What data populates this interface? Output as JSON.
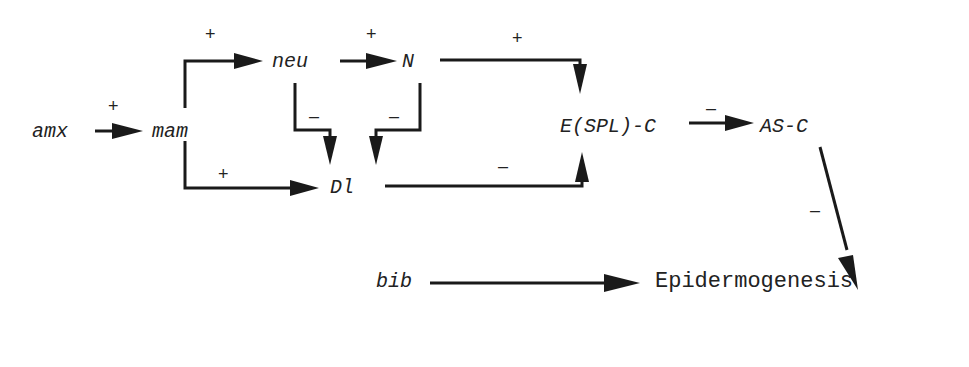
{
  "diagram": {
    "type": "regulatory-network",
    "nodes": {
      "amx": "amx",
      "mam": "mam",
      "neu": "neu",
      "N": "N",
      "Dl": "Dl",
      "ESPLC": "E(SPL)-C",
      "ASC": "AS-C",
      "bib": "bib",
      "epidermogenesis": "Epidermogenesis"
    },
    "edges": [
      {
        "from": "amx",
        "to": "mam",
        "sign": "+"
      },
      {
        "from": "mam",
        "to": "neu",
        "sign": "+"
      },
      {
        "from": "mam",
        "to": "Dl",
        "sign": "+"
      },
      {
        "from": "neu",
        "to": "N",
        "sign": "+"
      },
      {
        "from": "neu",
        "to": "Dl",
        "sign": "–"
      },
      {
        "from": "N",
        "to": "Dl",
        "sign": "–"
      },
      {
        "from": "N",
        "to": "E(SPL)-C",
        "sign": "+"
      },
      {
        "from": "Dl",
        "to": "E(SPL)-C",
        "sign": "–"
      },
      {
        "from": "E(SPL)-C",
        "to": "AS-C",
        "sign": "–"
      },
      {
        "from": "AS-C",
        "to": "Epidermogenesis",
        "sign": "–"
      },
      {
        "from": "bib",
        "to": "Epidermogenesis",
        "sign": ""
      }
    ],
    "signs": {
      "amx_mam": "+",
      "mam_neu": "+",
      "neu_N": "+",
      "N_ESPLC": "+",
      "neu_Dl": "–",
      "N_Dl": "–",
      "mam_Dl": "+",
      "Dl_ESPLC": "–",
      "ESPLC_ASC": "–",
      "ASC_epi": "–"
    }
  }
}
